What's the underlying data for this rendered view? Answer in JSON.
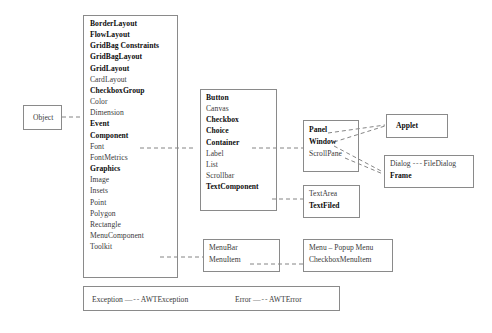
{
  "diagram": {
    "root": {
      "label": "Object"
    },
    "object_box": {
      "label": "Object"
    },
    "awt_main": {
      "items": [
        {
          "label": "BorderLayout",
          "bold": true
        },
        {
          "label": "FlowLayout",
          "bold": true
        },
        {
          "label": "GridBag Constraints",
          "bold": true
        },
        {
          "label": "GridBagLayout",
          "bold": true
        },
        {
          "label": "GridLayout",
          "bold": true
        },
        {
          "label": "CardLayout",
          "bold": false
        },
        {
          "label": "CheckboxGroup",
          "bold": true
        },
        {
          "label": "Color",
          "bold": false
        },
        {
          "label": "Dimension",
          "bold": false
        },
        {
          "label": "Event",
          "bold": true
        },
        {
          "label": "Component",
          "bold": true
        },
        {
          "label": "Font",
          "bold": false
        },
        {
          "label": "FontMetrics",
          "bold": false
        },
        {
          "label": "Graphics",
          "bold": true
        },
        {
          "label": "Image",
          "bold": false
        },
        {
          "label": "Insets",
          "bold": false
        },
        {
          "label": "Point",
          "bold": false
        },
        {
          "label": "Polygon",
          "bold": false
        },
        {
          "label": "Rectangle",
          "bold": false
        },
        {
          "label": "MenuComponent",
          "bold": false
        },
        {
          "label": "Toolkit",
          "bold": false
        }
      ]
    },
    "component_box": {
      "items": [
        {
          "label": "Button",
          "bold": true
        },
        {
          "label": "Canvas",
          "bold": false
        },
        {
          "label": "Checkbox",
          "bold": true
        },
        {
          "label": "Choice",
          "bold": true
        },
        {
          "label": "Container",
          "bold": true
        },
        {
          "label": "Label",
          "bold": false
        },
        {
          "label": "List",
          "bold": false
        },
        {
          "label": "Scrollbar",
          "bold": false
        },
        {
          "label": "TextComponent",
          "bold": true
        }
      ]
    },
    "container_box": {
      "items": [
        {
          "label": "Panel",
          "bold": true
        },
        {
          "label": "Window",
          "bold": true
        },
        {
          "label": "ScrollPane",
          "bold": false
        }
      ]
    },
    "applet_box": {
      "items": [
        {
          "label": "Applet",
          "bold": true
        }
      ]
    },
    "window_box": {
      "rows": [
        {
          "left": "Dialog",
          "connector": "- - -",
          "right": "FileDialog",
          "left_bold": false,
          "right_bold": false
        },
        {
          "left": "Frame",
          "connector": "",
          "right": "",
          "left_bold": true,
          "right_bold": false
        }
      ]
    },
    "text_box": {
      "items": [
        {
          "label": "TextArea",
          "bold": false
        },
        {
          "label": "TextFiled",
          "bold": true
        }
      ]
    },
    "menu_component_box": {
      "items": [
        {
          "label": "MenuBar",
          "bold": false
        },
        {
          "label": "MenuItem",
          "bold": false
        }
      ]
    },
    "menu_item_box": {
      "items": [
        {
          "label": "Menu – Popup Menu",
          "bold": false
        },
        {
          "label": "CheckboxMenuItem",
          "bold": false
        }
      ]
    },
    "exception_box": {
      "pairs": [
        {
          "left": "Exception",
          "connector": "— - -",
          "right": "AWTException"
        },
        {
          "left": "Error",
          "connector": "— - -",
          "right": "AWTError"
        }
      ]
    },
    "colors": {
      "border": "#8a8a8a",
      "line": "#777777",
      "text": "#3a3a3a",
      "text_bold": "#0d0d0d",
      "background": "#ffffff"
    }
  }
}
